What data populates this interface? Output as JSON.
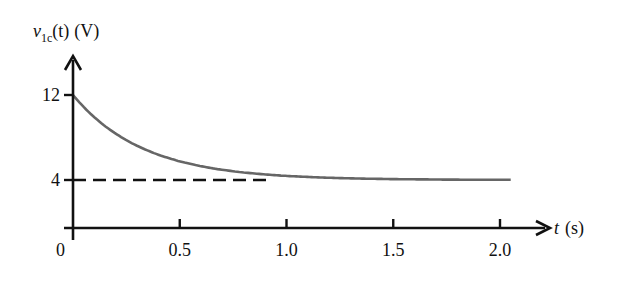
{
  "chart_data": {
    "type": "line",
    "title": "",
    "xlabel": "t (s)",
    "xlabel_var": "t",
    "xlabel_unit": "(s)",
    "ylabel": "v1c(t) (V)",
    "ylabel_var": "v",
    "ylabel_sub": "1c",
    "ylabel_arg": "(t)",
    "ylabel_unit": "(V)",
    "xlim": [
      0,
      2.2
    ],
    "ylim": [
      0,
      13.5
    ],
    "x_ticks": [
      0.5,
      1.0,
      1.5,
      2.0
    ],
    "x_tick_labels": [
      "0.5",
      "1.0",
      "1.5",
      "2.0"
    ],
    "origin_label": "0",
    "y_ticks": [
      4,
      12
    ],
    "y_tick_labels": [
      "4",
      "12"
    ],
    "grid": false,
    "legend": null,
    "series": [
      {
        "name": "v1c(t)",
        "style": "solid",
        "color": "#666666",
        "description": "exponential decay from 12 V to 4 V, v(t) = 4 + 8·e^(-t/0.33)",
        "x": [
          0,
          0.1,
          0.2,
          0.25,
          0.3,
          0.4,
          0.5,
          0.6,
          0.7,
          0.8,
          0.9,
          1.0,
          1.5,
          2.05
        ],
        "values": [
          12.0,
          9.9,
          8.36,
          7.74,
          7.22,
          6.38,
          5.76,
          5.3,
          4.96,
          4.71,
          4.52,
          4.39,
          4.08,
          4.02
        ]
      },
      {
        "name": "asymptote",
        "style": "dashed",
        "color": "#111111",
        "x": [
          0,
          0.92
        ],
        "values": [
          4,
          4
        ]
      }
    ]
  }
}
